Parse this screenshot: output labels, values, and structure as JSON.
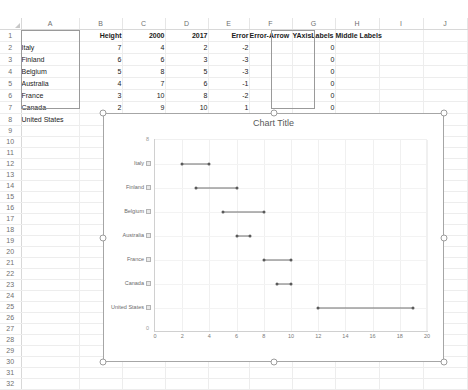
{
  "app": {
    "name": "spreadsheet",
    "column_headers": [
      "A",
      "B",
      "C",
      "D",
      "E",
      "F",
      "G",
      "H",
      "I",
      "J"
    ],
    "row_headers": [
      "1",
      "2",
      "3",
      "4",
      "5",
      "6",
      "7",
      "8",
      "9",
      "10",
      "11",
      "12",
      "13",
      "14",
      "15",
      "16",
      "17",
      "18",
      "19",
      "20",
      "21",
      "22",
      "23",
      "24",
      "25",
      "26",
      "27",
      "28",
      "29",
      "30",
      "31",
      "32"
    ]
  },
  "sheet": {
    "header_row": {
      "A": "",
      "B": "Height",
      "C": "2000",
      "D": "2017",
      "E": "Error",
      "F": "Error-Arrow",
      "G": "YAxisLabels",
      "H": "Middle Labels",
      "I": "",
      "J": ""
    },
    "rows": [
      {
        "label": "Italy",
        "height": "7",
        "y2000": "4",
        "y2017": "2",
        "error": "-2",
        "error_arrow": "",
        "yaxis_label": "0",
        "middle_label": ""
      },
      {
        "label": "Finland",
        "height": "6",
        "y2000": "6",
        "y2017": "3",
        "error": "-3",
        "error_arrow": "",
        "yaxis_label": "0",
        "middle_label": ""
      },
      {
        "label": "Belgium",
        "height": "5",
        "y2000": "8",
        "y2017": "5",
        "error": "-3",
        "error_arrow": "",
        "yaxis_label": "0",
        "middle_label": ""
      },
      {
        "label": "Australia",
        "height": "4",
        "y2000": "7",
        "y2017": "6",
        "error": "-1",
        "error_arrow": "",
        "yaxis_label": "0",
        "middle_label": ""
      },
      {
        "label": "France",
        "height": "3",
        "y2000": "10",
        "y2017": "8",
        "error": "-2",
        "error_arrow": "",
        "yaxis_label": "0",
        "middle_label": ""
      },
      {
        "label": "Canada",
        "height": "2",
        "y2000": "9",
        "y2017": "10",
        "error": "1",
        "error_arrow": "",
        "yaxis_label": "0",
        "middle_label": ""
      },
      {
        "label": "United States",
        "height": "1",
        "y2000": "12",
        "y2017": "19",
        "error": "7",
        "error_arrow": "",
        "yaxis_label": "0",
        "middle_label": ""
      }
    ],
    "selected_ranges": [
      "B2:B8",
      "G2:G8"
    ]
  },
  "chart": {
    "title": "Chart Title",
    "selected": true,
    "y_top_tick": "8",
    "y_bottom_tick": "0"
  },
  "chart_data": {
    "type": "scatter",
    "subtype": "dumbbell",
    "title": "Chart Title",
    "xlabel": "",
    "ylabel": "",
    "xlim": [
      0,
      20
    ],
    "ylim": [
      0,
      8
    ],
    "grid": true,
    "legend": false,
    "categories": [
      "Italy",
      "Finland",
      "Belgium",
      "Australia",
      "France",
      "Canada",
      "United States"
    ],
    "category_heights": [
      7,
      6,
      5,
      4,
      3,
      2,
      1
    ],
    "xticks": [
      0,
      2,
      4,
      6,
      8,
      10,
      12,
      14,
      16,
      18,
      20
    ],
    "series": [
      {
        "name": "2000",
        "values": [
          4,
          6,
          8,
          7,
          10,
          9,
          12
        ]
      },
      {
        "name": "2017",
        "values": [
          2,
          3,
          5,
          6,
          8,
          10,
          19
        ]
      }
    ],
    "error": [
      -2,
      -3,
      -3,
      -1,
      -2,
      1,
      7
    ],
    "yaxis_labels": [
      0,
      0,
      0,
      0,
      0,
      0,
      0
    ]
  }
}
